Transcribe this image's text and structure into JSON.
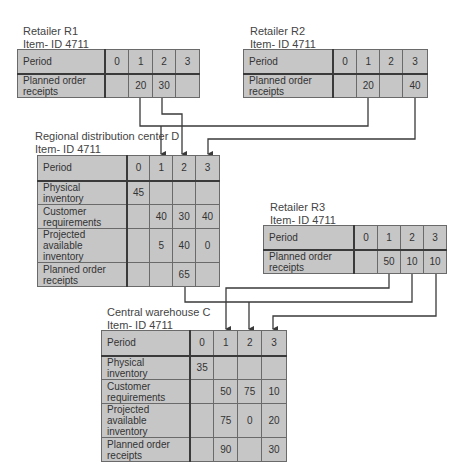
{
  "diagram": {
    "type": "MRP multi-echelon distribution network",
    "nodes": {
      "r1": {
        "title": "Retailer R1",
        "item": "Item- ID 4711",
        "periods": [
          "Period",
          "0",
          "1",
          "2",
          "3"
        ],
        "rows": [
          {
            "label": "Planned order receipts",
            "values": [
              "",
              "20",
              "30",
              ""
            ]
          }
        ]
      },
      "r2": {
        "title": "Retailer R2",
        "item": "Item- ID 4711",
        "periods": [
          "Period",
          "0",
          "1",
          "2",
          "3"
        ],
        "rows": [
          {
            "label": "Planned order receipts",
            "values": [
              "",
              "20",
              "",
              "40"
            ]
          }
        ]
      },
      "d": {
        "title": "Regional distribution center D",
        "item": "Item- ID 4711",
        "periods": [
          "Period",
          "0",
          "1",
          "2",
          "3"
        ],
        "rows": [
          {
            "label": "Physical inventory",
            "values": [
              "45",
              "",
              "",
              ""
            ]
          },
          {
            "label": "Customer requirements",
            "values": [
              "",
              "40",
              "30",
              "40"
            ]
          },
          {
            "label": "Projected available inventory",
            "values": [
              "",
              "5",
              "40",
              "0"
            ]
          },
          {
            "label": "Planned order receipts",
            "values": [
              "",
              "",
              "65",
              ""
            ]
          }
        ]
      },
      "r3": {
        "title": "Retailer R3",
        "item": "Item- ID 4711",
        "periods": [
          "Period",
          "0",
          "1",
          "2",
          "3"
        ],
        "rows": [
          {
            "label": "Planned order receipts",
            "values": [
              "",
              "50",
              "10",
              "10"
            ]
          }
        ]
      },
      "c": {
        "title": "Central warehouse C",
        "item": "Item- ID 4711",
        "periods": [
          "Period",
          "0",
          "1",
          "2",
          "3"
        ],
        "rows": [
          {
            "label": "Physical inventory",
            "values": [
              "35",
              "",
              "",
              ""
            ]
          },
          {
            "label": "Customer requirements",
            "values": [
              "",
              "50",
              "75",
              "10"
            ]
          },
          {
            "label": "Projected available inventory",
            "values": [
              "",
              "75",
              "0",
              "20"
            ]
          },
          {
            "label": "Planned order receipts",
            "values": [
              "",
              "90",
              "",
              "30"
            ]
          }
        ]
      }
    },
    "edges": [
      {
        "from": "r1",
        "from_period": "1",
        "to": "d",
        "to_period": "1"
      },
      {
        "from": "r2",
        "from_period": "1",
        "to": "d",
        "to_period": "1"
      },
      {
        "from": "r1",
        "from_period": "2",
        "to": "d",
        "to_period": "2"
      },
      {
        "from": "r2",
        "from_period": "3",
        "to": "d",
        "to_period": "3"
      },
      {
        "from": "d",
        "from_period": "2",
        "to": "c",
        "to_period": "2"
      },
      {
        "from": "r3",
        "from_period": "1",
        "to": "c",
        "to_period": "1"
      },
      {
        "from": "r3",
        "from_period": "2",
        "to": "c",
        "to_period": "2"
      },
      {
        "from": "r3",
        "from_period": "3",
        "to": "c",
        "to_period": "3"
      }
    ],
    "colors": {
      "cell_fill": "#c6c6c6",
      "grid": "#6a6a6a",
      "line": "#3a3a3a",
      "text": "#333333"
    }
  }
}
